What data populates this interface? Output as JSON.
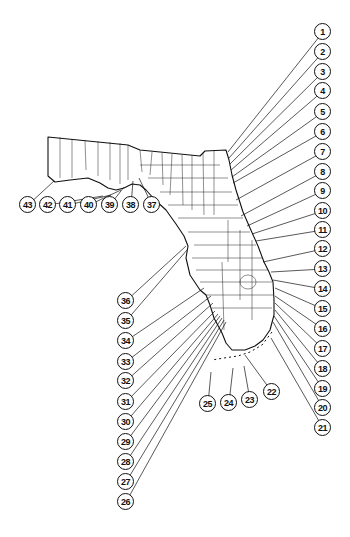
{
  "map": {
    "subject": "Florida counties with numbered coastal locations",
    "colors": {
      "ink": "#111111",
      "background": "#ffffff"
    }
  },
  "callouts": [
    {
      "label": "1",
      "x": 323,
      "y": 32,
      "tx": 228,
      "ty": 152
    },
    {
      "label": "2",
      "x": 323,
      "y": 52,
      "tx": 229,
      "ty": 158
    },
    {
      "label": "3",
      "x": 323,
      "y": 72,
      "tx": 230,
      "ty": 164
    },
    {
      "label": "4",
      "x": 323,
      "y": 91,
      "tx": 231,
      "ty": 170
    },
    {
      "label": "5",
      "x": 323,
      "y": 112,
      "tx": 232,
      "ty": 177
    },
    {
      "label": "6",
      "x": 323,
      "y": 132,
      "tx": 233,
      "ty": 183
    },
    {
      "label": "7",
      "x": 323,
      "y": 152,
      "tx": 236,
      "ty": 200
    },
    {
      "label": "8",
      "x": 323,
      "y": 172,
      "tx": 241,
      "ty": 216
    },
    {
      "label": "9",
      "x": 323,
      "y": 191,
      "tx": 247,
      "ty": 226
    },
    {
      "label": "10",
      "x": 323,
      "y": 211,
      "tx": 252,
      "ty": 234
    },
    {
      "label": "11",
      "x": 323,
      "y": 230,
      "tx": 256,
      "ty": 241
    },
    {
      "label": "12",
      "x": 323,
      "y": 249,
      "tx": 263,
      "ty": 262
    },
    {
      "label": "13",
      "x": 323,
      "y": 269,
      "tx": 271,
      "ty": 272
    },
    {
      "label": "14",
      "x": 323,
      "y": 289,
      "tx": 273,
      "ty": 280
    },
    {
      "label": "15",
      "x": 323,
      "y": 309,
      "tx": 275,
      "ty": 288
    },
    {
      "label": "16",
      "x": 323,
      "y": 329,
      "tx": 275,
      "ty": 296
    },
    {
      "label": "17",
      "x": 323,
      "y": 349,
      "tx": 275,
      "ty": 303
    },
    {
      "label": "18",
      "x": 323,
      "y": 369,
      "tx": 275,
      "ty": 310
    },
    {
      "label": "19",
      "x": 323,
      "y": 389,
      "tx": 274,
      "ty": 316
    },
    {
      "label": "20",
      "x": 323,
      "y": 408,
      "tx": 273,
      "ty": 322
    },
    {
      "label": "21",
      "x": 323,
      "y": 428,
      "tx": 271,
      "ty": 338
    },
    {
      "label": "22",
      "x": 272,
      "y": 392,
      "tx": 245,
      "ty": 355
    },
    {
      "label": "23",
      "x": 250,
      "y": 400,
      "tx": 244,
      "ty": 366
    },
    {
      "label": "24",
      "x": 229,
      "y": 403,
      "tx": 233,
      "ty": 368
    },
    {
      "label": "25",
      "x": 208,
      "y": 404,
      "tx": 211,
      "ty": 372
    },
    {
      "label": "26",
      "x": 126,
      "y": 502,
      "tx": 226,
      "ty": 322
    },
    {
      "label": "27",
      "x": 126,
      "y": 482,
      "tx": 224,
      "ty": 320
    },
    {
      "label": "28",
      "x": 126,
      "y": 462,
      "tx": 222,
      "ty": 318
    },
    {
      "label": "29",
      "x": 126,
      "y": 442,
      "tx": 220,
      "ty": 316
    },
    {
      "label": "30",
      "x": 126,
      "y": 422,
      "tx": 218,
      "ty": 314
    },
    {
      "label": "31",
      "x": 126,
      "y": 402,
      "tx": 215,
      "ty": 311
    },
    {
      "label": "32",
      "x": 126,
      "y": 381,
      "tx": 213,
      "ty": 303
    },
    {
      "label": "33",
      "x": 126,
      "y": 362,
      "tx": 211,
      "ty": 296
    },
    {
      "label": "34",
      "x": 126,
      "y": 341,
      "tx": 204,
      "ty": 288
    },
    {
      "label": "35",
      "x": 126,
      "y": 321,
      "tx": 187,
      "ty": 250
    },
    {
      "label": "36",
      "x": 126,
      "y": 301,
      "tx": 186,
      "ty": 246
    },
    {
      "label": "37",
      "x": 152,
      "y": 205,
      "tx": 139,
      "ty": 178
    },
    {
      "label": "38",
      "x": 131,
      "y": 205,
      "tx": 133,
      "ty": 181
    },
    {
      "label": "39",
      "x": 110,
      "y": 205,
      "tx": 124,
      "ty": 187
    },
    {
      "label": "40",
      "x": 89,
      "y": 205,
      "tx": 121,
      "ty": 190
    },
    {
      "label": "41",
      "x": 68,
      "y": 205,
      "tx": 111,
      "ty": 195
    },
    {
      "label": "42",
      "x": 48,
      "y": 205,
      "tx": 103,
      "ty": 196
    },
    {
      "label": "43",
      "x": 28,
      "y": 205,
      "tx": 54,
      "ty": 181
    }
  ]
}
